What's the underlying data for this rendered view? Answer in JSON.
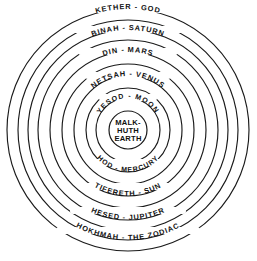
{
  "diagram": {
    "type": "concentric-circles",
    "background_color": "#ffffff",
    "stroke_color": "#1a1a1a",
    "text_color": "#111111",
    "center": {
      "cx": 128,
      "cy": 130
    },
    "center_label": {
      "name": "malkhuth-earth",
      "line1": "MALK-",
      "line2": "HUTH",
      "line3": "EARTH",
      "radius": 19
    },
    "rings": [
      {
        "index": 1,
        "name": "yesod-moon",
        "label": "YESOD  -  MOON",
        "radius": 32,
        "label_side": "top"
      },
      {
        "index": 2,
        "name": "hod-mercury",
        "label": "HOD  -  MERCURY",
        "radius": 42,
        "label_side": "bottom"
      },
      {
        "index": 3,
        "name": "netsah-venus",
        "label": "NETSAH  -  VENUS",
        "radius": 54,
        "label_side": "top"
      },
      {
        "index": 4,
        "name": "tifereth-sun",
        "label": "TIFERETH - SUN",
        "radius": 66,
        "label_side": "bottom"
      },
      {
        "index": 5,
        "name": "din-mars",
        "label": "DIN  -  MARS",
        "radius": 78,
        "label_side": "top"
      },
      {
        "index": 6,
        "name": "hesed-jupiter",
        "label": "HESED  -  JUPITER",
        "radius": 90,
        "label_side": "bottom"
      },
      {
        "index": 7,
        "name": "binah-saturn",
        "label": "BINAH  -  SATURN",
        "radius": 100,
        "label_side": "top"
      },
      {
        "index": 8,
        "name": "hokhmah-zodiac",
        "label": "HOKHMAH  -  THE ZODIAC",
        "radius": 110,
        "label_side": "bottom"
      },
      {
        "index": 9,
        "name": "kether-god",
        "label": "KETHER  -  GOD",
        "radius": 121,
        "label_side": "top"
      }
    ],
    "outer_boundary": {
      "name": "outer-circle",
      "radius": 121
    }
  }
}
